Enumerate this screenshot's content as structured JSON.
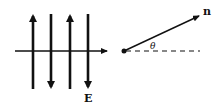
{
  "left_diagram": {
    "field_label": "E",
    "field_lines": [
      {
        "x": 33,
        "direction": "up"
      },
      {
        "x": 51,
        "direction": "down"
      },
      {
        "x": 70,
        "direction": "up"
      },
      {
        "x": 88,
        "direction": "down"
      }
    ],
    "axis_direction": "right"
  },
  "right_diagram": {
    "vector_label": "n",
    "angle_label": "θ"
  },
  "colors": {
    "ink": "#111111",
    "background": "#ffffff"
  }
}
